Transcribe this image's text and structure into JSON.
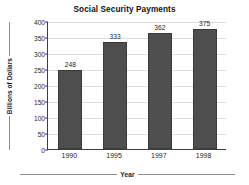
{
  "chart_data": {
    "type": "bar",
    "title": "Social Security Payments",
    "xlabel": "Year",
    "ylabel": "Billions of Dollars",
    "categories": [
      "1990",
      "1995",
      "1997",
      "1998"
    ],
    "values": [
      248,
      333,
      362,
      375
    ],
    "value_labels": [
      "248",
      "333",
      "362",
      "375"
    ],
    "ylim": [
      0,
      400
    ],
    "yticks": [
      0,
      50,
      100,
      150,
      200,
      250,
      300,
      350,
      400
    ],
    "ytick_labels": [
      "0",
      "50",
      "100",
      "150",
      "200",
      "250",
      "300",
      "350",
      "400"
    ],
    "grid": true,
    "legend": null,
    "series": [
      {
        "name": "Social Security Payments",
        "values": [
          248,
          333,
          362,
          375
        ],
        "color": "#4e4e4e"
      }
    ],
    "colors": {
      "bar": "#4e4e4e",
      "bar_border": "#3a3a3a",
      "axis": "#3d3d3d",
      "grid": "#dcdcdc",
      "text": "#1f1f1f",
      "background": "#ffffff"
    }
  }
}
